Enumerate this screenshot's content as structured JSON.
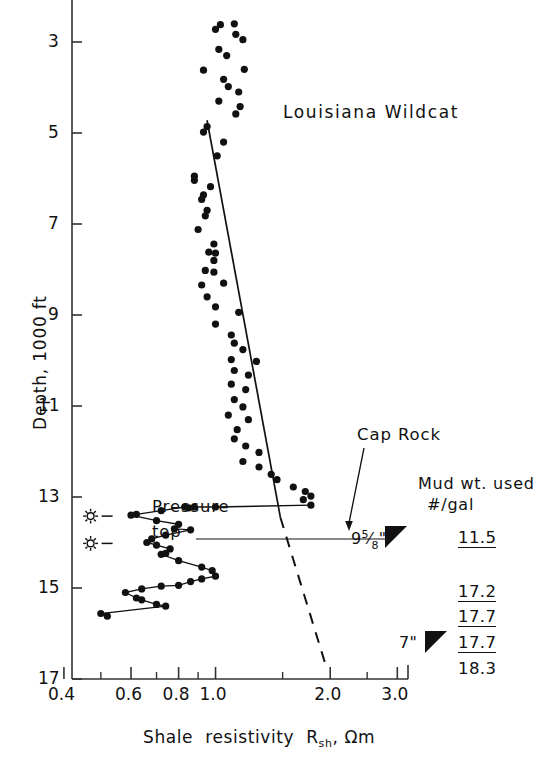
{
  "figure": {
    "title_annotation": "Louisiana Wildcat",
    "annotations": [
      {
        "name": "cap-rock",
        "text": "Cap Rock"
      },
      {
        "name": "pressure-top-line1",
        "text": "Pressure"
      },
      {
        "name": "pressure-top-line2",
        "text": "top"
      }
    ]
  },
  "mud_table": {
    "header_line1": "Mud wt. used",
    "header_line2": "#/gal",
    "rows": [
      {
        "casing": "9",
        "casing_frac": "5/8",
        "casing_unit": "\"",
        "value": "11.5",
        "underlined": true
      },
      {
        "casing": "",
        "casing_frac": "",
        "casing_unit": "",
        "value": "17.2",
        "underlined": true
      },
      {
        "casing": "",
        "casing_frac": "",
        "casing_unit": "",
        "value": "17.7",
        "underlined": true
      },
      {
        "casing": "7",
        "casing_frac": "",
        "casing_unit": "\"",
        "value": "17.7",
        "underlined": true
      },
      {
        "casing": "",
        "casing_frac": "",
        "casing_unit": "",
        "value": "18.3",
        "underlined": false
      }
    ]
  },
  "chart_data": {
    "type": "scatter",
    "title": "Louisiana Wildcat",
    "xlabel": "Shale resistivity R_sh, Ωm",
    "ylabel": "Depth, 1000 ft",
    "xscale": "log",
    "xlim": [
      0.42,
      3.2
    ],
    "ylim": [
      2.2,
      17.0
    ],
    "yticks": [
      3,
      5,
      7,
      9,
      11,
      13,
      15,
      17
    ],
    "ytick_labels": [
      "3",
      "5",
      "7",
      "9",
      "11",
      "13",
      "15",
      "17"
    ],
    "xticks_major": [
      0.4,
      0.6,
      0.8,
      1.0,
      2.0,
      3.0
    ],
    "xtick_labels": [
      "0.4",
      "0.6",
      "0.8",
      "1.0",
      "2.0",
      "3.0"
    ],
    "xticks_minor": [
      0.5,
      0.7,
      0.9,
      1.5,
      2.5
    ],
    "grid": false,
    "legend": "none",
    "series": [
      {
        "name": "shale-resistivity-scatter",
        "marker": "filled-circle",
        "points": [
          [
            1.03,
            2.62
          ],
          [
            1.12,
            2.6
          ],
          [
            1.0,
            2.72
          ],
          [
            1.13,
            2.83
          ],
          [
            1.18,
            2.95
          ],
          [
            1.02,
            3.16
          ],
          [
            1.07,
            3.3
          ],
          [
            0.93,
            3.62
          ],
          [
            1.19,
            3.6
          ],
          [
            1.05,
            3.82
          ],
          [
            1.08,
            3.98
          ],
          [
            1.15,
            4.1
          ],
          [
            1.02,
            4.3
          ],
          [
            1.16,
            4.42
          ],
          [
            1.13,
            4.58
          ],
          [
            0.95,
            4.86
          ],
          [
            0.93,
            4.98
          ],
          [
            1.05,
            5.2
          ],
          [
            1.01,
            5.5
          ],
          [
            0.88,
            5.95
          ],
          [
            0.88,
            6.04
          ],
          [
            0.97,
            6.18
          ],
          [
            0.93,
            6.36
          ],
          [
            0.92,
            6.46
          ],
          [
            0.95,
            6.7
          ],
          [
            0.94,
            6.82
          ],
          [
            0.9,
            7.12
          ],
          [
            0.99,
            7.44
          ],
          [
            0.96,
            7.62
          ],
          [
            1.0,
            7.64
          ],
          [
            0.99,
            7.8
          ],
          [
            0.94,
            8.02
          ],
          [
            0.99,
            8.06
          ],
          [
            0.92,
            8.34
          ],
          [
            1.05,
            8.3
          ],
          [
            0.95,
            8.6
          ],
          [
            1.0,
            8.82
          ],
          [
            1.15,
            8.94
          ],
          [
            1.0,
            9.2
          ],
          [
            1.1,
            9.44
          ],
          [
            1.12,
            9.62
          ],
          [
            1.18,
            9.76
          ],
          [
            1.1,
            9.98
          ],
          [
            1.28,
            10.02
          ],
          [
            1.12,
            10.22
          ],
          [
            1.22,
            10.32
          ],
          [
            1.1,
            10.52
          ],
          [
            1.2,
            10.64
          ],
          [
            1.12,
            10.86
          ],
          [
            1.18,
            11.02
          ],
          [
            1.08,
            11.2
          ],
          [
            1.22,
            11.3
          ],
          [
            1.14,
            11.52
          ],
          [
            1.12,
            11.72
          ],
          [
            1.2,
            11.88
          ],
          [
            1.3,
            12.02
          ],
          [
            1.18,
            12.22
          ],
          [
            1.3,
            12.34
          ],
          [
            1.4,
            12.5
          ],
          [
            1.45,
            12.62
          ],
          [
            1.6,
            12.78
          ],
          [
            1.72,
            12.88
          ],
          [
            1.78,
            12.98
          ],
          [
            1.7,
            13.06
          ]
        ]
      },
      {
        "name": "pressure-zone-profile",
        "marker": "filled-circle-connected",
        "points": [
          [
            1.78,
            13.18
          ],
          [
            1.0,
            13.22
          ],
          [
            0.88,
            13.22
          ],
          [
            0.85,
            13.24
          ],
          [
            0.83,
            13.22
          ],
          [
            0.72,
            13.3
          ],
          [
            0.62,
            13.38
          ],
          [
            0.6,
            13.4
          ],
          [
            0.7,
            13.52
          ],
          [
            0.8,
            13.6
          ],
          [
            0.78,
            13.7
          ],
          [
            0.86,
            13.72
          ],
          [
            0.74,
            13.84
          ],
          [
            0.68,
            13.92
          ],
          [
            0.66,
            14.0
          ],
          [
            0.7,
            14.06
          ],
          [
            0.76,
            14.14
          ],
          [
            0.74,
            14.24
          ],
          [
            0.72,
            14.26
          ],
          [
            0.8,
            14.4
          ],
          [
            0.92,
            14.54
          ],
          [
            0.98,
            14.62
          ],
          [
            1.0,
            14.74
          ],
          [
            0.92,
            14.8
          ],
          [
            0.86,
            14.86
          ],
          [
            0.8,
            14.94
          ],
          [
            0.72,
            14.96
          ],
          [
            0.64,
            15.02
          ],
          [
            0.58,
            15.1
          ],
          [
            0.62,
            15.22
          ],
          [
            0.64,
            15.26
          ],
          [
            0.7,
            15.36
          ],
          [
            0.74,
            15.4
          ],
          [
            0.5,
            15.56
          ],
          [
            0.52,
            15.62
          ]
        ]
      }
    ],
    "trend_line_solid": {
      "name": "normal-compaction-trend",
      "from": [
        0.95,
        4.72
      ],
      "to": [
        1.48,
        13.45
      ]
    },
    "trend_line_dashed": {
      "name": "extrapolated-trend",
      "from": [
        1.48,
        13.45
      ],
      "to": [
        1.95,
        16.72
      ]
    },
    "markers": [
      {
        "name": "kick-symbol-1",
        "x": 0.47,
        "y": 13.42,
        "symbol": "burst"
      },
      {
        "name": "kick-symbol-2",
        "x": 0.47,
        "y": 14.02,
        "symbol": "burst"
      }
    ]
  }
}
